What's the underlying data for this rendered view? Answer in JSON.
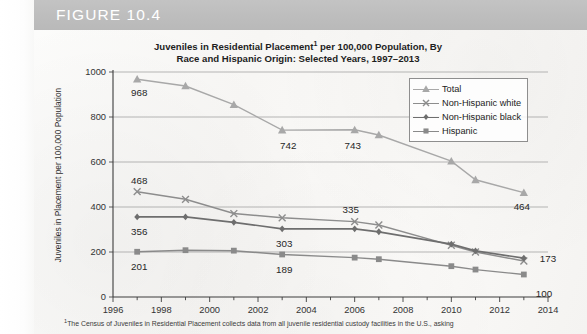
{
  "figure": {
    "label": "FIGURE 10.4",
    "band_color": "#bdbdbd"
  },
  "chart_title_line1": "Juveniles in Residential Placement",
  "chart_title_sup": "1",
  "chart_title_line1b": " per 100,000 Population, By",
  "chart_title_line2": "Race and Hispanic Origin: Selected Years, 1997–2013",
  "footnote_marker": "1",
  "footnote_text": "The Census of Juveniles in Residential Placement collects data from all juvenile residential custody facilities in the U.S., asking",
  "legend": {
    "items": [
      {
        "label": "Total",
        "marker": "triangle",
        "color": "#a8a8a8"
      },
      {
        "label": "Non-Hispanic white",
        "marker": "x",
        "color": "#8d8d8d"
      },
      {
        "label": "Non-Hispanic black",
        "marker": "diamond",
        "color": "#6e6e6e"
      },
      {
        "label": "Hispanic",
        "marker": "square",
        "color": "#8a8a8a"
      }
    ]
  },
  "chart_data": {
    "type": "line",
    "xlabel": "",
    "ylabel": "Juveniles in Placement per 100,000 Population",
    "xlim": [
      1996,
      2014
    ],
    "ylim": [
      0,
      1000
    ],
    "xticks": [
      1996,
      1998,
      2000,
      2002,
      2004,
      2006,
      2008,
      2010,
      2012,
      2014
    ],
    "yticks": [
      0,
      200,
      400,
      600,
      800,
      1000
    ],
    "grid": "horizontal",
    "legend_position": "top-right",
    "x": [
      1997,
      1999,
      2001,
      2003,
      2006,
      2007,
      2010,
      2011,
      2013
    ],
    "series": [
      {
        "name": "Total",
        "marker": "triangle",
        "color": "#a8a8a8",
        "values": [
          968,
          938,
          855,
          742,
          743,
          720,
          604,
          521,
          464
        ],
        "labels": [
          {
            "x": 1997,
            "y": 968,
            "text": "968"
          },
          {
            "x": 2003,
            "y": 742,
            "text": "742"
          },
          {
            "x": 2006,
            "y": 743,
            "text": "743"
          },
          {
            "x": 2013,
            "y": 464,
            "text": "464"
          }
        ]
      },
      {
        "name": "Non-Hispanic white",
        "marker": "x",
        "color": "#8d8d8d",
        "values": [
          468,
          434,
          371,
          352,
          335,
          320,
          230,
          200,
          160
        ],
        "labels": [
          {
            "x": 1997,
            "y": 468,
            "text": "468"
          },
          {
            "x": 2006,
            "y": 335,
            "text": "335"
          }
        ]
      },
      {
        "name": "Non-Hispanic black",
        "marker": "diamond",
        "color": "#6e6e6e",
        "values": [
          356,
          356,
          332,
          303,
          303,
          290,
          235,
          205,
          173
        ],
        "labels": [
          {
            "x": 1997,
            "y": 356,
            "text": "356"
          },
          {
            "x": 2003,
            "y": 303,
            "text": "303"
          },
          {
            "x": 2013,
            "y": 173,
            "text": "173"
          }
        ]
      },
      {
        "name": "Hispanic",
        "marker": "square",
        "color": "#8a8a8a",
        "values": [
          201,
          208,
          206,
          189,
          175,
          168,
          137,
          122,
          100
        ],
        "labels": [
          {
            "x": 1997,
            "y": 201,
            "text": "201"
          },
          {
            "x": 2003,
            "y": 189,
            "text": "189"
          },
          {
            "x": 2013,
            "y": 100,
            "text": "100"
          }
        ]
      }
    ]
  }
}
